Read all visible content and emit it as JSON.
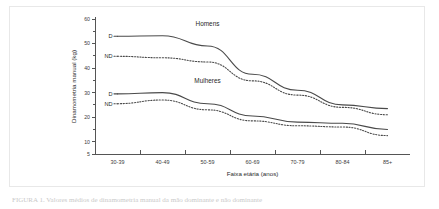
{
  "chart_data": {
    "type": "line",
    "title": "",
    "xlabel": "Faixa etária (anos)",
    "ylabel": "Dinamometria manual (kg)",
    "categories": [
      "30-39",
      "40-49",
      "50-59",
      "60-69",
      "70-79",
      "80-84",
      "85+"
    ],
    "ylim": [
      5,
      60
    ],
    "yticks": [
      5,
      10,
      20,
      30,
      40,
      50,
      60
    ],
    "ytick_labels": [
      "5",
      "10",
      "20",
      "30",
      "40",
      "50",
      "60"
    ],
    "grid": false,
    "legend_position": "inline-left",
    "group_labels": [
      {
        "text": "Homens",
        "x_category": "50-59",
        "value": 57
      },
      {
        "text": "Mulheres",
        "x_category": "50-59",
        "value": 34
      }
    ],
    "series": [
      {
        "name": "Homens D",
        "group": "Homens",
        "hand": "D",
        "style": "solid",
        "label": "D",
        "values": [
          53.0,
          53.2,
          49.0,
          37.5,
          31.0,
          25.0,
          23.5
        ]
      },
      {
        "name": "Homens ND",
        "group": "Homens",
        "hand": "ND",
        "style": "dotted",
        "label": "ND",
        "values": [
          44.8,
          44.2,
          42.5,
          34.8,
          29.0,
          24.0,
          21.0
        ]
      },
      {
        "name": "Mulheres D",
        "group": "Mulheres",
        "hand": "D",
        "style": "solid",
        "label": "D",
        "values": [
          29.5,
          30.0,
          25.5,
          20.5,
          18.0,
          17.5,
          15.0
        ]
      },
      {
        "name": "Mulheres ND",
        "group": "Mulheres",
        "hand": "ND",
        "style": "dotted",
        "label": "ND",
        "values": [
          25.5,
          27.0,
          23.0,
          18.5,
          16.5,
          16.0,
          12.5
        ]
      }
    ]
  },
  "caption": {
    "text": "FIGURA 1. Valores médios de dinamometria manual da mão dominante e não dominante"
  }
}
